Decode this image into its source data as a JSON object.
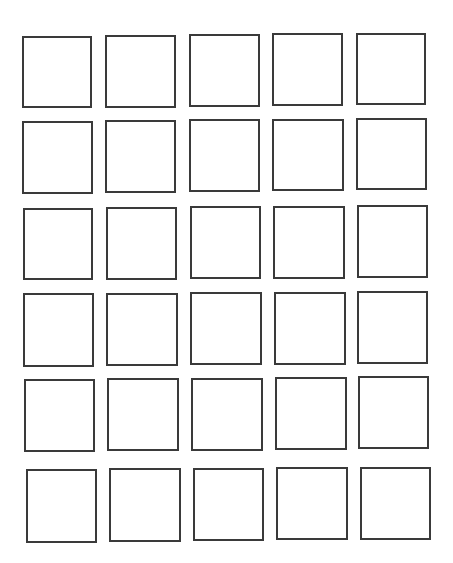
{
  "grid": {
    "rows": 6,
    "cols": 5,
    "stroke_color": "#3a3a3a",
    "background": "#ffffff",
    "squares": [
      {
        "row": 1,
        "col": 1,
        "x": 22,
        "y": 36,
        "w": 70,
        "h": 72
      },
      {
        "row": 1,
        "col": 2,
        "x": 105,
        "y": 35,
        "w": 71,
        "h": 73
      },
      {
        "row": 1,
        "col": 3,
        "x": 189,
        "y": 34,
        "w": 71,
        "h": 73
      },
      {
        "row": 1,
        "col": 4,
        "x": 272,
        "y": 33,
        "w": 71,
        "h": 73
      },
      {
        "row": 1,
        "col": 5,
        "x": 356,
        "y": 33,
        "w": 70,
        "h": 72
      },
      {
        "row": 2,
        "col": 1,
        "x": 22,
        "y": 121,
        "w": 71,
        "h": 73
      },
      {
        "row": 2,
        "col": 2,
        "x": 105,
        "y": 120,
        "w": 71,
        "h": 73
      },
      {
        "row": 2,
        "col": 3,
        "x": 189,
        "y": 119,
        "w": 71,
        "h": 73
      },
      {
        "row": 2,
        "col": 4,
        "x": 272,
        "y": 119,
        "w": 72,
        "h": 72
      },
      {
        "row": 2,
        "col": 5,
        "x": 356,
        "y": 118,
        "w": 71,
        "h": 72
      },
      {
        "row": 3,
        "col": 1,
        "x": 23,
        "y": 208,
        "w": 70,
        "h": 72
      },
      {
        "row": 3,
        "col": 2,
        "x": 106,
        "y": 207,
        "w": 71,
        "h": 73
      },
      {
        "row": 3,
        "col": 3,
        "x": 190,
        "y": 206,
        "w": 71,
        "h": 73
      },
      {
        "row": 3,
        "col": 4,
        "x": 273,
        "y": 206,
        "w": 72,
        "h": 73
      },
      {
        "row": 3,
        "col": 5,
        "x": 357,
        "y": 205,
        "w": 71,
        "h": 73
      },
      {
        "row": 4,
        "col": 1,
        "x": 23,
        "y": 293,
        "w": 71,
        "h": 74
      },
      {
        "row": 4,
        "col": 2,
        "x": 106,
        "y": 293,
        "w": 72,
        "h": 73
      },
      {
        "row": 4,
        "col": 3,
        "x": 190,
        "y": 292,
        "w": 72,
        "h": 73
      },
      {
        "row": 4,
        "col": 4,
        "x": 274,
        "y": 292,
        "w": 72,
        "h": 73
      },
      {
        "row": 4,
        "col": 5,
        "x": 357,
        "y": 291,
        "w": 71,
        "h": 73
      },
      {
        "row": 5,
        "col": 1,
        "x": 24,
        "y": 379,
        "w": 71,
        "h": 73
      },
      {
        "row": 5,
        "col": 2,
        "x": 107,
        "y": 378,
        "w": 72,
        "h": 73
      },
      {
        "row": 5,
        "col": 3,
        "x": 191,
        "y": 378,
        "w": 72,
        "h": 73
      },
      {
        "row": 5,
        "col": 4,
        "x": 275,
        "y": 377,
        "w": 72,
        "h": 73
      },
      {
        "row": 5,
        "col": 5,
        "x": 358,
        "y": 376,
        "w": 71,
        "h": 73
      },
      {
        "row": 6,
        "col": 1,
        "x": 26,
        "y": 469,
        "w": 71,
        "h": 74
      },
      {
        "row": 6,
        "col": 2,
        "x": 109,
        "y": 468,
        "w": 72,
        "h": 74
      },
      {
        "row": 6,
        "col": 3,
        "x": 193,
        "y": 468,
        "w": 71,
        "h": 73
      },
      {
        "row": 6,
        "col": 4,
        "x": 276,
        "y": 467,
        "w": 72,
        "h": 73
      },
      {
        "row": 6,
        "col": 5,
        "x": 360,
        "y": 467,
        "w": 71,
        "h": 73
      }
    ]
  }
}
